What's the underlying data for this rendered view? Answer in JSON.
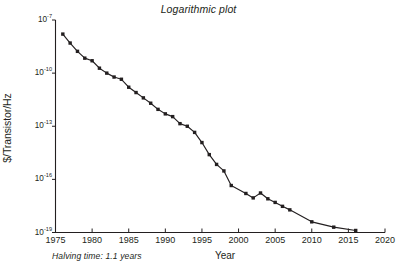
{
  "chart_data": {
    "type": "line",
    "title": "Logarithmic plot",
    "xlabel": "Year",
    "ylabel": "$/Transistor/Hz",
    "annotation": "Halving time: 1.1 years",
    "yscale": "log",
    "xlim": [
      1975,
      2020
    ],
    "ylim": [
      1e-19,
      1e-07
    ],
    "xticks": [
      1975,
      1980,
      1985,
      1990,
      1995,
      2000,
      2005,
      2010,
      2015,
      2020
    ],
    "xticklabels": [
      "1975",
      "1980",
      "1985",
      "1990",
      "1995",
      "2000",
      "2005",
      "2010",
      "2015",
      "2020"
    ],
    "yticks": [
      1e-07,
      1e-10,
      1e-13,
      1e-16,
      1e-19
    ],
    "yticklabels": [
      {
        "mantissa": "10",
        "exponent": "-7"
      },
      {
        "mantissa": "10",
        "exponent": "-10"
      },
      {
        "mantissa": "10",
        "exponent": "-13"
      },
      {
        "mantissa": "10",
        "exponent": "-16"
      },
      {
        "mantissa": "10",
        "exponent": "-19"
      }
    ],
    "grid": "horizontal",
    "legend": "none",
    "marker": "filled-square",
    "line_color": "#231f20",
    "grid_color": "#e8e8ec",
    "x": [
      1976,
      1977,
      1978,
      1979,
      1980,
      1981,
      1982,
      1983,
      1984,
      1985,
      1986,
      1987,
      1988,
      1989,
      1990,
      1991,
      1992,
      1993,
      1994,
      1995,
      1996,
      1997,
      1998,
      1999,
      2001,
      2002,
      2003,
      2004,
      2005,
      2006,
      2007,
      2010,
      2013,
      2016
    ],
    "y": [
      1.6e-08,
      5e-09,
      1.7e-09,
      7e-10,
      5e-10,
      1.9e-10,
      1e-10,
      6e-11,
      4.5e-11,
      1.6e-11,
      8e-12,
      4e-12,
      2e-12,
      9e-13,
      5e-13,
      3.5e-13,
      1.4e-13,
      1e-13,
      4.5e-14,
      1.2e-14,
      2.5e-15,
      7e-16,
      3e-16,
      4.5e-17,
      1.6e-17,
      9e-18,
      1.7e-17,
      8e-18,
      5e-18,
      3e-18,
      1.9e-18,
      4e-19,
      2e-19,
      1.3e-19
    ]
  }
}
